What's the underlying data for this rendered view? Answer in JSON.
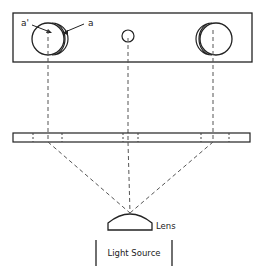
{
  "diagram": {
    "labels": {
      "a_prime": "a'",
      "a": "a",
      "lens": "Lens",
      "light_source": "Light Source"
    },
    "colors": {
      "line": "#222222",
      "dashed": "#555555",
      "background": "#ffffff"
    },
    "components": [
      {
        "name": "top-plate",
        "description": "rectangular plate with three circular apertures"
      },
      {
        "name": "strip",
        "description": "thin horizontal strip with dashed tick marks"
      },
      {
        "name": "lens",
        "description": "plano-convex lens"
      },
      {
        "name": "light-source",
        "description": "light source box"
      }
    ]
  }
}
